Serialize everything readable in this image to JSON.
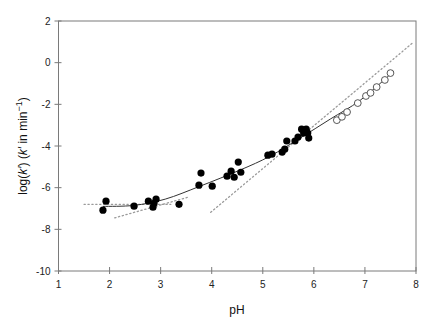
{
  "chart_data": {
    "type": "scatter",
    "title": "",
    "xlabel": "pH",
    "ylabel": "log(k′) (k′ in min⁻¹)",
    "ylabel_parts": {
      "pre": "log(",
      "k1": "k′",
      "mid": ") (",
      "k2": "k′",
      "post": " in min",
      "sup": "−1",
      "close": ")"
    },
    "xlim": [
      1,
      8
    ],
    "ylim": [
      -10,
      2
    ],
    "xticks": [
      1,
      2,
      3,
      4,
      5,
      6,
      7,
      8
    ],
    "yticks": [
      -10,
      -8,
      -6,
      -4,
      -2,
      0,
      2
    ],
    "grid": false,
    "legend": null,
    "series": [
      {
        "name": "filled",
        "marker": "filled-circle",
        "color": "#000000",
        "points": [
          [
            1.87,
            -7.08
          ],
          [
            1.93,
            -6.65
          ],
          [
            2.48,
            -6.89
          ],
          [
            2.76,
            -6.65
          ],
          [
            2.85,
            -6.94
          ],
          [
            2.87,
            -6.75
          ],
          [
            2.91,
            -6.55
          ],
          [
            3.36,
            -6.8
          ],
          [
            3.75,
            -5.88
          ],
          [
            3.79,
            -5.3
          ],
          [
            4.01,
            -5.93
          ],
          [
            4.3,
            -5.45
          ],
          [
            4.38,
            -5.21
          ],
          [
            4.44,
            -5.5
          ],
          [
            4.52,
            -4.77
          ],
          [
            4.57,
            -5.26
          ],
          [
            5.1,
            -4.44
          ],
          [
            5.18,
            -4.39
          ],
          [
            5.38,
            -4.29
          ],
          [
            5.43,
            -4.15
          ],
          [
            5.47,
            -3.76
          ],
          [
            5.63,
            -3.76
          ],
          [
            5.69,
            -3.57
          ],
          [
            5.76,
            -3.19
          ],
          [
            5.85,
            -3.19
          ],
          [
            5.88,
            -3.38
          ],
          [
            5.9,
            -3.62
          ],
          [
            5.8,
            -3.38
          ]
        ]
      },
      {
        "name": "open",
        "marker": "open-circle",
        "color": "#000000",
        "points": [
          [
            6.45,
            -2.76
          ],
          [
            6.55,
            -2.6
          ],
          [
            6.65,
            -2.37
          ],
          [
            6.86,
            -1.94
          ],
          [
            7.02,
            -1.6
          ],
          [
            7.11,
            -1.45
          ],
          [
            7.23,
            -1.17
          ],
          [
            7.39,
            -0.83
          ],
          [
            7.5,
            -0.5
          ]
        ]
      }
    ],
    "fit_curve": {
      "style": "solid",
      "color": "#333333",
      "points": [
        [
          1.87,
          -6.9
        ],
        [
          2.48,
          -6.85
        ],
        [
          3.09,
          -6.55
        ],
        [
          3.77,
          -5.93
        ],
        [
          4.55,
          -5.16
        ],
        [
          5.14,
          -4.49
        ],
        [
          5.73,
          -3.62
        ],
        [
          6.32,
          -2.71
        ],
        [
          6.91,
          -1.8
        ],
        [
          7.57,
          -0.4
        ]
      ]
    },
    "asymptotes": [
      {
        "style": "dotted",
        "color": "#9a9a9a",
        "from": [
          1.5,
          -6.8
        ],
        "to": [
          3.2,
          -6.8
        ]
      },
      {
        "style": "dotted",
        "color": "#9a9a9a",
        "from": [
          2.1,
          -7.45
        ],
        "to": [
          3.55,
          -6.45
        ]
      },
      {
        "style": "dotted",
        "color": "#9a9a9a",
        "from": [
          3.98,
          -7.18
        ],
        "to": [
          7.95,
          0.98
        ]
      }
    ]
  }
}
